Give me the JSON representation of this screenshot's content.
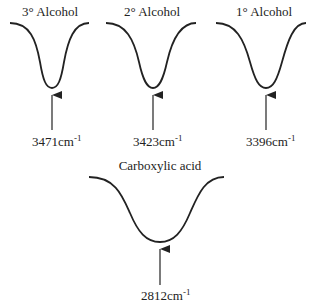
{
  "diagram": {
    "type": "ir-absorption-bands",
    "peaks": [
      {
        "label": "3° Alcohol",
        "wavenumber": "3471",
        "unit": "cm",
        "exponent": "-1"
      },
      {
        "label": "2° Alcohol",
        "wavenumber": "3423",
        "unit": "cm",
        "exponent": "-1"
      },
      {
        "label": "1° Alcohol",
        "wavenumber": "3396",
        "unit": "cm",
        "exponent": "-1"
      },
      {
        "label": "Carboxylic acid",
        "wavenumber": "2812",
        "unit": "cm",
        "exponent": "-1"
      }
    ],
    "colors": {
      "line": "#222222",
      "background": "#ffffff"
    }
  }
}
